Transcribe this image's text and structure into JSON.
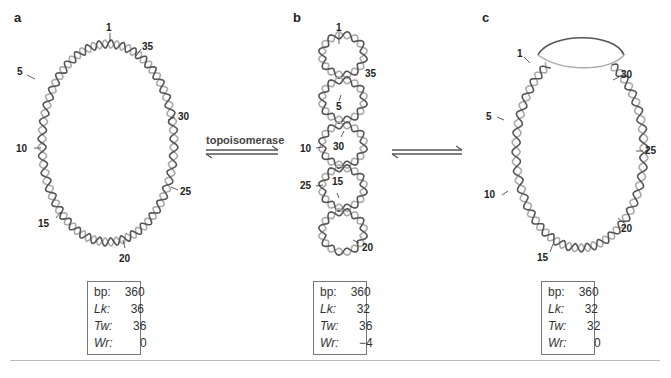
{
  "panels": [
    {
      "letter": "a",
      "labels": [
        "1",
        "35",
        "5",
        "30",
        "10",
        "25",
        "15",
        "20"
      ],
      "table": {
        "rows": [
          {
            "key": "bp:",
            "value": "360"
          },
          {
            "key": "Lk:",
            "value": "36"
          },
          {
            "key": "Tw:",
            "value": "36"
          },
          {
            "key": "Wr:",
            "value": "0"
          }
        ]
      }
    },
    {
      "letter": "b",
      "labels": [
        "1",
        "35",
        "5",
        "10",
        "30",
        "25",
        "15",
        "20"
      ],
      "table": {
        "rows": [
          {
            "key": "bp:",
            "value": "360"
          },
          {
            "key": "Lk:",
            "value": "32"
          },
          {
            "key": "Tw:",
            "value": "36"
          },
          {
            "key": "Wr:",
            "value": "−4"
          }
        ]
      }
    },
    {
      "letter": "c",
      "labels": [
        "1",
        "30",
        "5",
        "25",
        "10",
        "20",
        "15"
      ],
      "table": {
        "rows": [
          {
            "key": "bp:",
            "value": "360"
          },
          {
            "key": "Lk:",
            "value": "32"
          },
          {
            "key": "Tw:",
            "value": "32"
          },
          {
            "key": "Wr:",
            "value": "0"
          }
        ]
      }
    }
  ],
  "arrows": {
    "ab_label": "topoisomerase",
    "ab_icon": "equilibrium-arrows-icon",
    "bc_icon": "equilibrium-arrows-icon"
  },
  "colors": {
    "strand_dark": "#555555",
    "strand_light": "#aaaaaa",
    "text": "#222222",
    "box_border": "#777777"
  }
}
